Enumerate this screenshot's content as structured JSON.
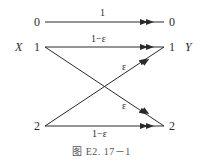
{
  "diagram": {
    "type": "binary-erasure-like channel transition diagram",
    "input_label": "X",
    "output_label": "Y",
    "inputs": [
      "0",
      "1",
      "2"
    ],
    "outputs": [
      "0",
      "1",
      "2"
    ],
    "edges": [
      {
        "from": "0",
        "to": "0",
        "label": "1"
      },
      {
        "from": "1",
        "to": "1",
        "label": "1−ε"
      },
      {
        "from": "1",
        "to": "2",
        "label": "ε"
      },
      {
        "from": "2",
        "to": "1",
        "label": "ε"
      },
      {
        "from": "2",
        "to": "2",
        "label": "1−ε"
      }
    ],
    "caption": "图 E2. 17－1"
  }
}
